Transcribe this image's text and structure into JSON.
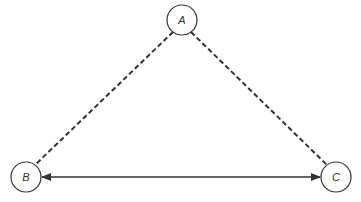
{
  "diagram": {
    "type": "graph",
    "nodes": [
      {
        "id": "A",
        "label": "A",
        "cx": 182,
        "cy": 20,
        "r": 15
      },
      {
        "id": "B",
        "label": "B",
        "cx": 26,
        "cy": 177,
        "r": 15
      },
      {
        "id": "C",
        "label": "C",
        "cx": 336,
        "cy": 177,
        "r": 15
      }
    ],
    "edges": [
      {
        "from": "A",
        "to": "B",
        "style": "dashed",
        "arrow": "none"
      },
      {
        "from": "A",
        "to": "C",
        "style": "dashed",
        "arrow": "none"
      },
      {
        "from": "B",
        "to": "C",
        "style": "solid",
        "arrow": "both"
      }
    ],
    "colors": {
      "stroke": "#333333",
      "background": "#ffffff"
    }
  }
}
